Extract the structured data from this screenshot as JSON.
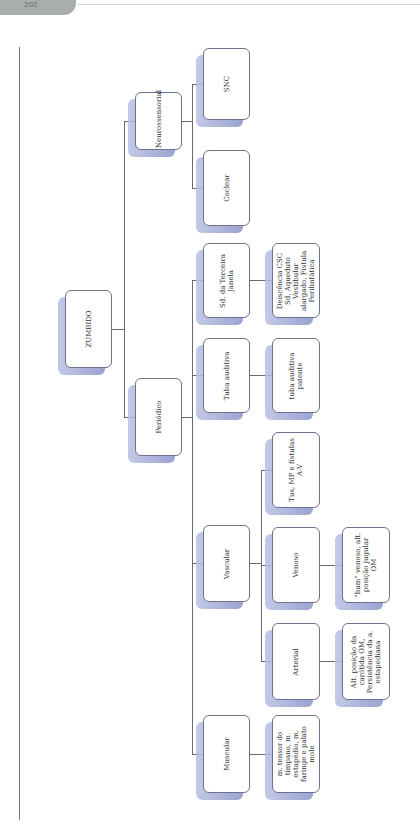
{
  "page_header": {
    "page_number": "202",
    "running_title": "",
    "tab_color": "#a9adab"
  },
  "colors": {
    "box_border": "#6f7190",
    "box_shadow": "#9aa4d4",
    "connector": "#6b6b6b"
  },
  "diagram": {
    "orientation": "rotated 90° counter-clockwise",
    "root": "ZUMBIDO",
    "nodes": {
      "zumbido": "ZUMBIDO",
      "neurossensorial": "Neurossensorial",
      "periodico": "Periódico",
      "snc": "SNC",
      "coclear": "Coclear",
      "terceira_janela": "Sd. da Terceira Janela",
      "tuba": "Tuba auditiva",
      "vascular": "Vascular",
      "muscular": "Muscular",
      "deiscencia": "Deiscência CSC Sd. Aqueduto Vestibular alargado, Fístula Perilinfática",
      "tuba_patente": "tuba auditiva patente",
      "tus_mp": "Tus, MP e fístulas A-V",
      "venoso": "Venoso",
      "arterial": "Arterial",
      "hum_venoso": "\"hum\" venoso, alt. posição jugular OM",
      "alt_posicao": "Alt. posição da carótida OM, Persistência da a. estapediana",
      "m_tensor": "m. tensor do tímpano, m. estapédio, m. faringe e palato mole"
    },
    "tree": {
      "ZUMBIDO": [
        "Neurossensorial",
        "Periódico"
      ],
      "Neurossensorial": [
        "SNC",
        "Coclear"
      ],
      "Periódico": [
        "Sd. da Terceira Janela",
        "Tuba auditiva",
        "Vascular",
        "Muscular"
      ],
      "Sd. da Terceira Janela": [
        "Deiscência CSC Sd. Aqueduto Vestibular alargado, Fístula Perilinfática"
      ],
      "Tuba auditiva": [
        "tuba auditiva patente"
      ],
      "Vascular": [
        "Tus, MP e fístulas A-V",
        "Venoso",
        "Arterial"
      ],
      "Venoso": [
        "\"hum\" venoso, alt. posição jugular OM"
      ],
      "Arterial": [
        "Alt. posição da carótida OM, Persistência da a. estapediana"
      ],
      "Muscular": [
        "m. tensor do tímpano, m. estapédio, m. faringe e palato mole"
      ]
    }
  }
}
